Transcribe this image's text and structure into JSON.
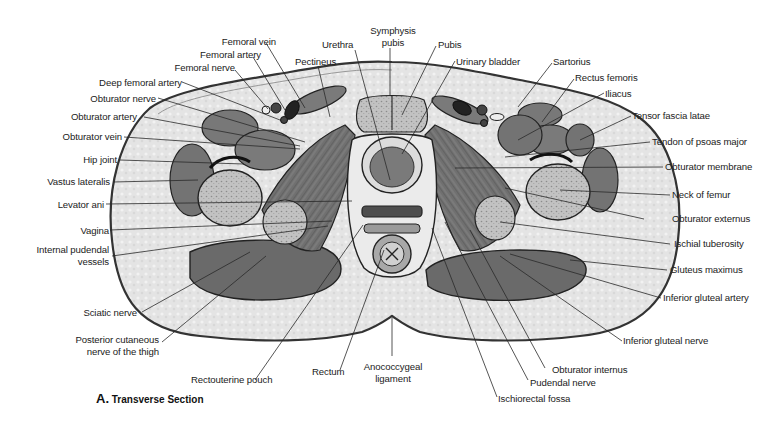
{
  "figure": {
    "caption_letter": "A.",
    "caption_text": "Transverse Section"
  },
  "labels": {
    "left": [
      {
        "id": "femoral-vein",
        "text": "Femoral vein"
      },
      {
        "id": "femoral-artery",
        "text": "Femoral artery"
      },
      {
        "id": "femoral-nerve",
        "text": "Femoral nerve"
      },
      {
        "id": "deep-femoral-artery",
        "text": "Deep femoral artery"
      },
      {
        "id": "obturator-nerve",
        "text": "Obturator nerve"
      },
      {
        "id": "obturator-artery",
        "text": "Obturator artery"
      },
      {
        "id": "obturator-vein",
        "text": "Obturator vein"
      },
      {
        "id": "hip-joint",
        "text": "Hip joint"
      },
      {
        "id": "vastus-lateralis",
        "text": "Vastus lateralis"
      },
      {
        "id": "levator-ani",
        "text": "Levator ani"
      },
      {
        "id": "vagina",
        "text": "Vagina"
      },
      {
        "id": "internal-pudendal-vessels-1",
        "text": "Internal pudendal"
      },
      {
        "id": "internal-pudendal-vessels-2",
        "text": "vessels"
      },
      {
        "id": "sciatic-nerve",
        "text": "Sciatic nerve"
      },
      {
        "id": "posterior-cutaneous-1",
        "text": "Posterior cutaneous"
      },
      {
        "id": "posterior-cutaneous-2",
        "text": "nerve of the thigh"
      }
    ],
    "top": [
      {
        "id": "pectineus",
        "text": "Pectineus"
      },
      {
        "id": "urethra",
        "text": "Urethra"
      },
      {
        "id": "symphysis-pubis-1",
        "text": "Symphysis"
      },
      {
        "id": "symphysis-pubis-2",
        "text": "pubis"
      },
      {
        "id": "pubis",
        "text": "Pubis"
      },
      {
        "id": "urinary-bladder",
        "text": "Urinary bladder"
      }
    ],
    "right": [
      {
        "id": "sartorius",
        "text": "Sartorius"
      },
      {
        "id": "rectus-femoris",
        "text": "Rectus femoris"
      },
      {
        "id": "iliacus",
        "text": "Iliacus"
      },
      {
        "id": "tensor-fascia-latae",
        "text": "Tensor fascia latae"
      },
      {
        "id": "tendon-psoas-major",
        "text": "Tendon of psoas major"
      },
      {
        "id": "obturator-membrane",
        "text": "Obturator membrane"
      },
      {
        "id": "neck-of-femur",
        "text": "Neck of femur"
      },
      {
        "id": "obturator-externus",
        "text": "Obturator externus"
      },
      {
        "id": "ischial-tuberosity",
        "text": "Ischial tuberosity"
      },
      {
        "id": "gluteus-maximus",
        "text": "Gluteus maximus"
      },
      {
        "id": "inferior-gluteal-artery",
        "text": "Inferior gluteal artery"
      },
      {
        "id": "inferior-gluteal-nerve",
        "text": "Inferior gluteal nerve"
      }
    ],
    "bottom": [
      {
        "id": "rectouterine-pouch",
        "text": "Rectouterine pouch"
      },
      {
        "id": "rectum",
        "text": "Rectum"
      },
      {
        "id": "anococcygeal-1",
        "text": "Anococcygeal"
      },
      {
        "id": "anococcygeal-2",
        "text": "ligament"
      },
      {
        "id": "obturator-internus",
        "text": "Obturator internus"
      },
      {
        "id": "pudendal-nerve",
        "text": "Pudendal nerve"
      },
      {
        "id": "ischiorectal-fossa",
        "text": "Ischiorectal fossa"
      }
    ]
  },
  "colors": {
    "skin_outline": "#333333",
    "fat": "#e6e6e6",
    "muscle": "#6e6e6e",
    "muscle_light": "#8a8a8a",
    "bone": "#b9b9b9",
    "leader": "#2a2a2a"
  }
}
